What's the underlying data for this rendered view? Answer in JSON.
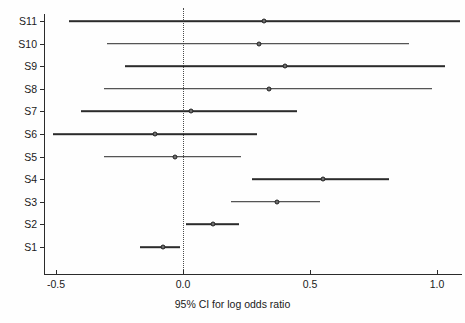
{
  "figure": {
    "kind": "forest-plot",
    "background": "#ffffff",
    "line_color": "#2b2b2b",
    "marker_fill": "#6e6e6e",
    "marker_edge": "#222222",
    "reference_line_style": "dotted"
  },
  "chart_data": {
    "type": "scatter",
    "title": "",
    "xlabel": "95% CI for log odds ratio",
    "ylabel": "",
    "xlim": [
      -0.56,
      1.12
    ],
    "ylim": [
      0,
      12
    ],
    "grid": false,
    "legend": null,
    "reference_line": 0.0,
    "xticks": [
      -0.5,
      0.0,
      0.5,
      1.0
    ],
    "xticklabels": [
      "-0.5",
      "0.0",
      "0.5",
      "1.0"
    ],
    "categories": [
      "S1",
      "S2",
      "S3",
      "S4",
      "S5",
      "S6",
      "S7",
      "S8",
      "S9",
      "S10",
      "S11"
    ],
    "yticklabels_top_to_bottom": [
      "S11",
      "S10",
      "S9",
      "S8",
      "S7",
      "S6",
      "S5",
      "S4",
      "S3",
      "S2",
      "S1"
    ],
    "studies": [
      {
        "label": "S11",
        "estimate": 0.32,
        "ci_low": -0.45,
        "ci_high": 1.09
      },
      {
        "label": "S10",
        "estimate": 0.3,
        "ci_low": -0.3,
        "ci_high": 0.89
      },
      {
        "label": "S9",
        "estimate": 0.4,
        "ci_low": -0.23,
        "ci_high": 1.03
      },
      {
        "label": "S8",
        "estimate": 0.34,
        "ci_low": -0.31,
        "ci_high": 0.98
      },
      {
        "label": "S7",
        "estimate": 0.03,
        "ci_low": -0.4,
        "ci_high": 0.45
      },
      {
        "label": "S6",
        "estimate": -0.11,
        "ci_low": -0.51,
        "ci_high": 0.29
      },
      {
        "label": "S5",
        "estimate": -0.03,
        "ci_low": -0.31,
        "ci_high": 0.23
      },
      {
        "label": "S4",
        "estimate": 0.55,
        "ci_low": 0.27,
        "ci_high": 0.81
      },
      {
        "label": "S3",
        "estimate": 0.37,
        "ci_low": 0.19,
        "ci_high": 0.54
      },
      {
        "label": "S2",
        "estimate": 0.12,
        "ci_low": 0.01,
        "ci_high": 0.22
      },
      {
        "label": "S1",
        "estimate": -0.08,
        "ci_low": -0.17,
        "ci_high": -0.01
      }
    ]
  },
  "axis": {
    "x_title": "95% CI for log odds ratio"
  }
}
